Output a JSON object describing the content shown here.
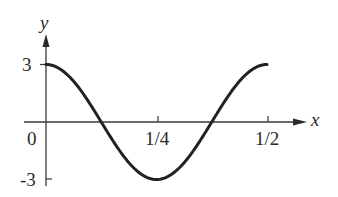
{
  "chart_data": {
    "type": "line",
    "title": "",
    "xlabel": "x",
    "ylabel": "y",
    "function": "y = 3 cos(4πx)",
    "x_ticks": [
      {
        "value": 0,
        "label": "0"
      },
      {
        "value": 0.25,
        "label": "1/4"
      },
      {
        "value": 0.5,
        "label": "1/2"
      }
    ],
    "y_ticks": [
      {
        "value": 3,
        "label": "3"
      },
      {
        "value": -3,
        "label": "-3"
      }
    ],
    "xlim": [
      0,
      0.55
    ],
    "ylim": [
      -3,
      3.6
    ],
    "grid": false,
    "legend": null,
    "series": [
      {
        "name": "curve",
        "x": [
          0,
          0.0625,
          0.125,
          0.1875,
          0.25,
          0.3125,
          0.375,
          0.4375,
          0.5
        ],
        "values": [
          3,
          2.12,
          0,
          -2.12,
          -3,
          -2.12,
          0,
          2.12,
          3
        ]
      }
    ],
    "color": "#222222"
  },
  "axes": {
    "x_axis_label": "x",
    "y_axis_label": "y",
    "origin_label": "0",
    "tick_labels": {
      "x_quarter": "1/4",
      "x_half": "1/2",
      "y_pos": "3",
      "y_neg": "-3"
    }
  }
}
